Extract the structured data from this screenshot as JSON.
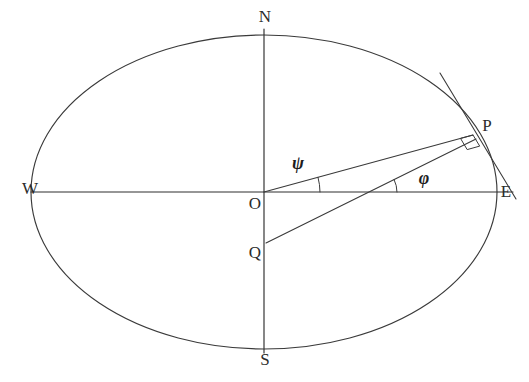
{
  "figure": {
    "kind": "geometry-diagram",
    "title": "",
    "background_color": "#ffffff",
    "line_color": "#3a3a3a",
    "label_color": "#2b2b2b",
    "width": 529,
    "height": 382
  },
  "ellipse": {
    "name": "meridian-ellipse",
    "cx": 264,
    "cy": 192,
    "rx": 233,
    "ry": 157
  },
  "cardinal_labels": [
    {
      "key": "N",
      "text": "N",
      "x": 265,
      "y": 18
    },
    {
      "key": "S",
      "text": "S",
      "x": 265,
      "y": 361
    },
    {
      "key": "W",
      "text": "W",
      "x": 30,
      "y": 190
    },
    {
      "key": "E",
      "text": "E",
      "x": 506,
      "y": 193
    }
  ],
  "point_labels": [
    {
      "key": "O",
      "text": "O",
      "x": 255,
      "y": 205
    },
    {
      "key": "Q",
      "text": "Q",
      "x": 255,
      "y": 254
    },
    {
      "key": "P",
      "text": "P",
      "x": 487,
      "y": 127
    }
  ],
  "angle_labels": [
    {
      "key": "psi",
      "text": "ψ",
      "x": 298,
      "y": 165
    },
    {
      "key": "phi",
      "text": "φ",
      "x": 424,
      "y": 180
    }
  ],
  "axes": {
    "horizontal": {
      "x1": 31,
      "y1": 192,
      "x2": 513,
      "y2": 192
    },
    "vertical": {
      "x1": 264,
      "y1": 29,
      "x2": 264,
      "y2": 353
    }
  },
  "segments": [
    {
      "key": "OP",
      "label": "O-to-P radius",
      "x1": 264,
      "y1": 192,
      "x2": 473,
      "y2": 135
    },
    {
      "key": "QP",
      "label": "Q-to-P normal",
      "x1": 266,
      "y1": 243,
      "x2": 476,
      "y2": 139
    }
  ],
  "tangent": {
    "key": "tangent-at-P",
    "x1": 440,
    "y1": 73,
    "x2": 516,
    "y2": 199
  },
  "right_angle": {
    "key": "right-angle-at-P",
    "size": 13
  },
  "angles": {
    "psi": {
      "value_deg": 15.3,
      "vertex": "O",
      "from": "E",
      "to": "P"
    },
    "phi": {
      "value_deg": 26.4,
      "vertex": "axis-intersection",
      "from": "E",
      "to": "P"
    }
  },
  "legend_note": ""
}
